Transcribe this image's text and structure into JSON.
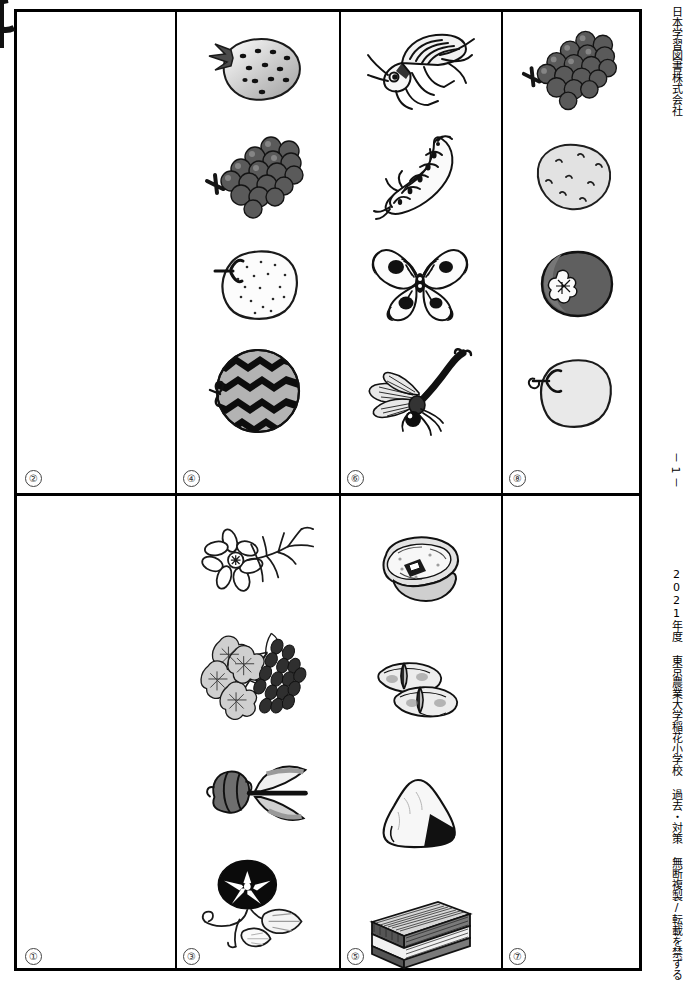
{
  "document": {
    "publisher_vertical": "日本学習図書株式会社",
    "footer_vertical": "2021年度 東京農業大学稲花小学校 過去・対策 無断複製/転載を禁ずる",
    "page_number": "－ 1 －"
  },
  "grid": {
    "rows": 2,
    "columns": 4,
    "cells": [
      {
        "id": "cell-2",
        "label": "②",
        "row": "top",
        "column": 1,
        "items": []
      },
      {
        "id": "cell-4",
        "label": "④",
        "row": "top",
        "column": 2,
        "items": [
          {
            "name": "strawberry",
            "icon": "strawberry-icon"
          },
          {
            "name": "grapes",
            "icon": "grapes-icon"
          },
          {
            "name": "asian-pear",
            "icon": "pear-icon"
          },
          {
            "name": "watermelon",
            "icon": "watermelon-icon"
          }
        ]
      },
      {
        "id": "cell-6",
        "label": "⑥",
        "row": "top",
        "column": 3,
        "items": [
          {
            "name": "grasshopper",
            "icon": "grasshopper-icon"
          },
          {
            "name": "lizard",
            "icon": "lizard-icon"
          },
          {
            "name": "butterfly",
            "icon": "butterfly-icon"
          },
          {
            "name": "dragonfly",
            "icon": "dragonfly-icon"
          }
        ]
      },
      {
        "id": "cell-8",
        "label": "⑧",
        "row": "top",
        "column": 4,
        "items": [
          {
            "name": "grapes",
            "icon": "grapes-icon"
          },
          {
            "name": "potato",
            "icon": "potato-icon"
          },
          {
            "name": "eggplant-halved",
            "icon": "eggplant-icon"
          },
          {
            "name": "apple",
            "icon": "apple-icon"
          }
        ]
      },
      {
        "id": "cell-1",
        "label": "①",
        "row": "bottom",
        "column": 1,
        "items": []
      },
      {
        "id": "cell-3",
        "label": "③",
        "row": "bottom",
        "column": 2,
        "items": [
          {
            "name": "cosmos-flower",
            "icon": "cosmos-icon"
          },
          {
            "name": "hydrangea",
            "icon": "hydrangea-icon"
          },
          {
            "name": "tulip",
            "icon": "tulip-icon"
          },
          {
            "name": "morning-glory",
            "icon": "morning-glory-icon"
          }
        ]
      },
      {
        "id": "cell-5",
        "label": "⑤",
        "row": "bottom",
        "column": 3,
        "items": [
          {
            "name": "sushi-roll",
            "icon": "sushi-roll-icon"
          },
          {
            "name": "gyoza-dumplings",
            "icon": "gyoza-icon"
          },
          {
            "name": "onigiri-rice-ball",
            "icon": "onigiri-icon"
          },
          {
            "name": "layer-cake-slice",
            "icon": "cake-icon"
          }
        ]
      },
      {
        "id": "cell-7",
        "label": "⑦",
        "row": "bottom",
        "column": 4,
        "items": []
      }
    ]
  },
  "colors": {
    "ink": "#000000",
    "paper": "#ffffff",
    "mid_gray": "#8c8c8c",
    "light_gray": "#d9d9d9",
    "dark_gray": "#4a4a4a"
  }
}
